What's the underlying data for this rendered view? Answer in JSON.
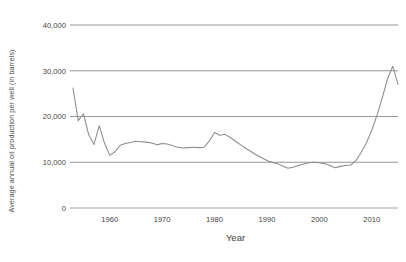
{
  "chart_data": {
    "type": "line",
    "title": "",
    "xlabel": "Year",
    "ylabel": "Average annual oil production per well (in barrels)",
    "xlim": [
      1953,
      2015
    ],
    "ylim": [
      0,
      40000
    ],
    "grid": true,
    "legend": "none",
    "x_ticks": [
      "1960",
      "1970",
      "1980",
      "1990",
      "2000",
      "2010"
    ],
    "x_tick_values": [
      1960,
      1970,
      1980,
      1990,
      2000,
      2010
    ],
    "y_ticks": [
      "0",
      "10,000",
      "20,000",
      "30,000",
      "40,000"
    ],
    "y_tick_values": [
      0,
      10000,
      20000,
      30000,
      40000
    ],
    "series": [
      {
        "name": "Average annual oil production per well",
        "color": "#8d8d8d",
        "x": [
          1953,
          1954,
          1955,
          1956,
          1957,
          1958,
          1959,
          1960,
          1961,
          1962,
          1963,
          1964,
          1965,
          1966,
          1967,
          1968,
          1969,
          1970,
          1971,
          1972,
          1973,
          1974,
          1975,
          1976,
          1977,
          1978,
          1979,
          1980,
          1981,
          1982,
          1983,
          1984,
          1985,
          1986,
          1987,
          1988,
          1989,
          1990,
          1991,
          1992,
          1993,
          1994,
          1995,
          1996,
          1997,
          1998,
          1999,
          2000,
          2001,
          2002,
          2003,
          2004,
          2005,
          2006,
          2007,
          2008,
          2009,
          2010,
          2011,
          2012,
          2013,
          2014,
          2015
        ],
        "y": [
          26200,
          19100,
          20600,
          16000,
          13900,
          18000,
          14200,
          11500,
          12300,
          13700,
          14100,
          14300,
          14600,
          14500,
          14400,
          14200,
          13800,
          14100,
          14000,
          13600,
          13300,
          13100,
          13200,
          13300,
          13200,
          13300,
          14600,
          16500,
          15900,
          16100,
          15400,
          14600,
          13800,
          13000,
          12300,
          11600,
          11000,
          10400,
          10000,
          9700,
          9200,
          8700,
          8900,
          9300,
          9600,
          9900,
          10000,
          9900,
          9700,
          9300,
          8800,
          9100,
          9300,
          9400,
          10400,
          12200,
          14300,
          17000,
          20300,
          24100,
          28200,
          31000,
          27000
        ]
      }
    ]
  },
  "axis": {
    "x_title": "Year",
    "y_title": "Average annual oil production per well (in barrels)"
  }
}
